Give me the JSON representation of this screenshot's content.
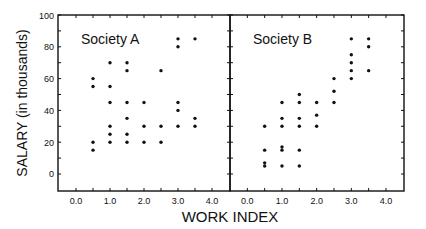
{
  "chart_data": [
    {
      "type": "scatter",
      "title": "Society A",
      "xlabel": "WORK INDEX",
      "ylabel": "SALARY (in thousands)",
      "xlim": [
        -0.53,
        4.53
      ],
      "ylim": [
        -10.7,
        100
      ],
      "xticks": [
        0.0,
        1.0,
        2.0,
        3.0,
        4.0
      ],
      "xtick_labels": [
        "0.0",
        "1.0",
        "2.0",
        "3.0",
        "4.0"
      ],
      "yticks": [
        0,
        20,
        40,
        60,
        80,
        100
      ],
      "ytick_labels": [
        "0",
        "20",
        "40",
        "60",
        "80",
        "100"
      ],
      "grid": false,
      "points": [
        [
          0.5,
          60
        ],
        [
          0.5,
          55
        ],
        [
          0.5,
          20
        ],
        [
          0.5,
          15
        ],
        [
          1.0,
          70
        ],
        [
          1.0,
          55
        ],
        [
          1.0,
          45
        ],
        [
          1.0,
          30
        ],
        [
          1.0,
          25
        ],
        [
          1.0,
          20
        ],
        [
          1.5,
          70
        ],
        [
          1.5,
          65
        ],
        [
          1.5,
          45
        ],
        [
          1.5,
          35
        ],
        [
          1.5,
          25
        ],
        [
          1.5,
          20
        ],
        [
          2.0,
          45
        ],
        [
          2.0,
          30
        ],
        [
          2.0,
          20
        ],
        [
          2.5,
          65
        ],
        [
          2.5,
          30
        ],
        [
          2.5,
          20
        ],
        [
          3.0,
          85
        ],
        [
          3.0,
          80
        ],
        [
          3.0,
          45
        ],
        [
          3.0,
          40
        ],
        [
          3.0,
          30
        ],
        [
          3.5,
          85
        ],
        [
          3.5,
          35
        ],
        [
          3.5,
          30
        ]
      ]
    },
    {
      "type": "scatter",
      "title": "Society B",
      "xlabel": "WORK INDEX",
      "ylabel": "SALARY (in thousands)",
      "xlim": [
        -0.5,
        4.52
      ],
      "ylim": [
        -10.7,
        100
      ],
      "xticks": [
        0.0,
        1.0,
        2.0,
        3.0,
        4.0
      ],
      "xtick_labels": [
        "0.0",
        "1.0",
        "2.0",
        "3.0",
        "4.0"
      ],
      "yticks": [
        0,
        20,
        40,
        60,
        80,
        100
      ],
      "grid": false,
      "points": [
        [
          0.5,
          30
        ],
        [
          0.5,
          15
        ],
        [
          0.5,
          7
        ],
        [
          0.5,
          5
        ],
        [
          1.0,
          45
        ],
        [
          1.0,
          35
        ],
        [
          1.0,
          30
        ],
        [
          1.0,
          17
        ],
        [
          1.0,
          15
        ],
        [
          1.0,
          5
        ],
        [
          1.5,
          50
        ],
        [
          1.5,
          45
        ],
        [
          1.5,
          35
        ],
        [
          1.5,
          30
        ],
        [
          1.5,
          15
        ],
        [
          1.5,
          5
        ],
        [
          2.0,
          45
        ],
        [
          2.0,
          37
        ],
        [
          2.0,
          30
        ],
        [
          2.5,
          60
        ],
        [
          2.5,
          52
        ],
        [
          2.5,
          45
        ],
        [
          3.0,
          85
        ],
        [
          3.0,
          75
        ],
        [
          3.0,
          70
        ],
        [
          3.0,
          65
        ],
        [
          3.0,
          60
        ],
        [
          3.5,
          85
        ],
        [
          3.5,
          80
        ],
        [
          3.5,
          65
        ]
      ]
    }
  ],
  "labels": {
    "panel_a_title": "Society A",
    "panel_b_title": "Society B",
    "x_axis_label": "WORK INDEX",
    "y_axis_label": "SALARY (in thousands)"
  },
  "colors": {
    "axis": "#111111",
    "point": "#111111",
    "background": "#ffffff"
  }
}
